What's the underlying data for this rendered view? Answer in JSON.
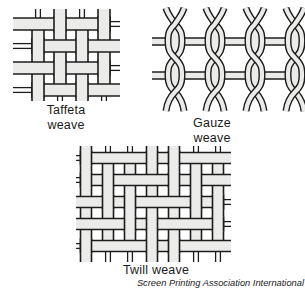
{
  "figure": {
    "caption": "Screen Printing Association International"
  },
  "colors": {
    "thread_fill": "#ebebe9",
    "thread_outline": "#1c1c1c",
    "text": "#1a1a1a",
    "background": "#ffffff"
  },
  "diagrams": {
    "taffeta": {
      "label_line1": "Taffeta",
      "label_line2": "weave",
      "weave": "plain",
      "cols": 4,
      "rows": 4
    },
    "gauze": {
      "label_line1": "Gauze",
      "label_line2": "weave",
      "weave": "leno",
      "pairs": 4,
      "bars": 2
    },
    "twill": {
      "label_line1": "Twill weave",
      "weave": "twill",
      "cols": 7,
      "rows": 5
    }
  }
}
